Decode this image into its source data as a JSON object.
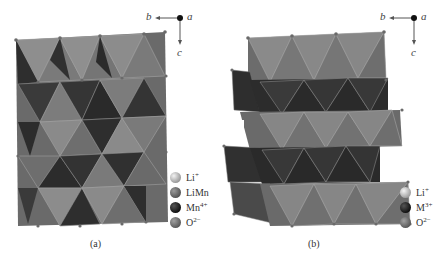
{
  "figure": {
    "panels": [
      {
        "id": "a",
        "caption": "(a)",
        "axes": {
          "horizontal": "b",
          "out_of_plane": "a",
          "vertical": "c"
        },
        "legend": [
          {
            "label": "Li",
            "sup": "+",
            "color": "#bfbfbf"
          },
          {
            "label": "LiMn",
            "sup": "",
            "color": "#6e6e6e"
          },
          {
            "label": "Mn",
            "sup": "4+",
            "color": "#2a2a2a"
          },
          {
            "label": "O",
            "sup": "2−",
            "color": "#7a7a7a"
          }
        ]
      },
      {
        "id": "b",
        "caption": "(b)",
        "axes": {
          "horizontal": "b",
          "out_of_plane": "a",
          "vertical": "c"
        },
        "legend": [
          {
            "label": "Li",
            "sup": "+",
            "color": "#c4c4c4"
          },
          {
            "label": "M",
            "sup": "3+",
            "color": "#2a2a2a"
          },
          {
            "label": "O",
            "sup": "2−",
            "color": "#7a7a7a"
          }
        ]
      }
    ],
    "colors": {
      "light_face": "#8c8c8c",
      "mid_face": "#6a6a6a",
      "dark_face": "#3a3a3a",
      "darkest_face": "#262626",
      "edge": "#a0a0a0",
      "vertex": "#6a6a6a"
    }
  }
}
